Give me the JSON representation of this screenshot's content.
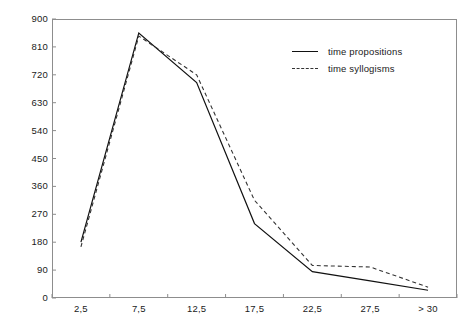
{
  "chart_data": {
    "type": "line",
    "title": "",
    "subtitle": "",
    "xlabel": "",
    "ylabel": "",
    "grid": false,
    "legend_position": "top-right",
    "categories": [
      "2,5",
      "7,5",
      "12,5",
      "17,5",
      "22,5",
      "27,5",
      "> 30"
    ],
    "x_tick_labels": [
      "2,5",
      "7,5",
      "12,5",
      "17,5",
      "22,5",
      "27,5",
      "> 30"
    ],
    "y_tick_labels": [
      "900",
      "810",
      "720",
      "630",
      "540",
      "450",
      "360",
      "270",
      "180",
      "90",
      "0"
    ],
    "xlim": [
      0,
      7
    ],
    "ylim": [
      0,
      900
    ],
    "y_step": 90,
    "series": [
      {
        "name": "time propositions",
        "style": "solid",
        "color": "#111111",
        "values": [
          180,
          855,
          695,
          240,
          85,
          55,
          25
        ]
      },
      {
        "name": "time syllogisms",
        "style": "dashed",
        "color": "#333333",
        "values": [
          165,
          845,
          720,
          315,
          105,
          100,
          35
        ]
      }
    ]
  },
  "legend": {
    "items": [
      {
        "label": "time propositions",
        "style": "solid"
      },
      {
        "label": "time syllogisms",
        "style": "dashed"
      }
    ]
  },
  "axes": {
    "y_ticks": [
      "900",
      "810",
      "720",
      "630",
      "540",
      "450",
      "360",
      "270",
      "180",
      "90",
      "0"
    ],
    "x_ticks": [
      "2,5",
      "7,5",
      "12,5",
      "17,5",
      "22,5",
      "27,5",
      "> 30"
    ]
  },
  "colors": {
    "frame": "#8d8d8d",
    "solid_series": "#111111",
    "dashed_series": "#333333",
    "text": "#1a1a1a",
    "background": "#ffffff"
  }
}
